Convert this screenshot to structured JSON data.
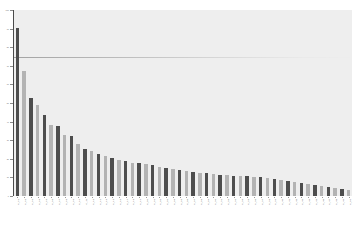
{
  "chart_data": {
    "type": "bar",
    "title": "",
    "subtitle": "",
    "xlabel": "",
    "ylabel": "",
    "grid": false,
    "legend": null,
    "ylim": [
      0,
      100
    ],
    "yticks": [
      0,
      10,
      20,
      30,
      40,
      50,
      60,
      70,
      80,
      90,
      100
    ],
    "ytick_labels": [
      "0",
      "10",
      "20",
      "30",
      "40",
      "50",
      "60",
      "70",
      "80",
      "90",
      "100"
    ],
    "reference_line": {
      "value": 75,
      "label": ""
    },
    "bar_colors": [
      "#4d4d4d",
      "#b3b3b3"
    ],
    "plot_background": "#eeeeee",
    "figure_background": "#ffffff",
    "categories": [
      "C_01",
      "C_02",
      "C_03",
      "C_04",
      "C_05",
      "C_06",
      "C_07",
      "C_08",
      "C_09",
      "C_10",
      "C_11",
      "C_12",
      "C_13",
      "C_14",
      "C_15",
      "C_16",
      "C_17",
      "C_18",
      "C_19",
      "C_20",
      "C_21",
      "C_22",
      "C_23",
      "C_24",
      "C_25",
      "C_26",
      "C_27",
      "C_28",
      "C_29",
      "C_30",
      "C_31",
      "C_32",
      "C_33",
      "C_34",
      "C_35",
      "C_36",
      "C_37",
      "C_38",
      "C_39",
      "C_40",
      "C_41",
      "C_42",
      "C_43",
      "C_44",
      "C_45",
      "C_46",
      "C_47",
      "C_48",
      "C_49",
      "C_50"
    ],
    "values": [
      90.5,
      67.0,
      52.5,
      49.0,
      43.5,
      38.0,
      37.5,
      33.0,
      32.5,
      28.0,
      25.5,
      24.0,
      22.5,
      21.5,
      20.5,
      19.5,
      19.0,
      18.0,
      17.5,
      17.0,
      16.5,
      15.5,
      15.0,
      14.5,
      14.0,
      13.5,
      13.0,
      12.5,
      12.5,
      12.0,
      11.5,
      11.5,
      11.0,
      10.5,
      10.5,
      10.0,
      10.0,
      9.5,
      9.0,
      8.5,
      8.0,
      7.5,
      7.0,
      6.5,
      6.0,
      5.5,
      5.0,
      4.5,
      4.0,
      3.5
    ]
  }
}
